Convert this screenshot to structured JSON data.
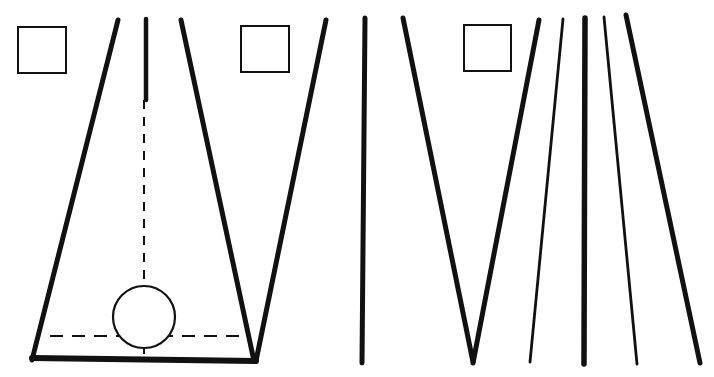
{
  "diagram": {
    "title": "",
    "colors": {
      "ink": "#111111",
      "background": "#ffffff"
    },
    "figures": [
      {
        "id": "fig-1",
        "description": "Tipi frame with three poles crossing at apex, base line, central dashed axis and circle (hearth/floor plan)",
        "checkbox": {
          "x": 18,
          "y": 27,
          "w": 48,
          "h": 46
        },
        "apex": [
          146,
          95
        ],
        "poles": [
          {
            "x1": 118,
            "y1": 20,
            "x2": 32,
            "y2": 360,
            "w": 5
          },
          {
            "x1": 146,
            "y1": 19,
            "x2": 146,
            "y2": 100,
            "w": 4.5
          },
          {
            "x1": 181,
            "y1": 20,
            "x2": 254,
            "y2": 361,
            "w": 5
          }
        ],
        "base": {
          "x1": 32,
          "y1": 358,
          "x2": 256,
          "y2": 361,
          "w": 6
        },
        "dashed_vertical": {
          "x": 144,
          "y1": 100,
          "y2": 286
        },
        "dashed_horizontal": {
          "y": 336,
          "x1": 50,
          "x2": 246
        },
        "circle": {
          "cx": 144,
          "cy": 317,
          "r": 31
        }
      },
      {
        "id": "fig-2",
        "description": "Three poles crossing at apex, center pole vertical",
        "checkbox": {
          "x": 241,
          "y": 26,
          "w": 48,
          "h": 46
        },
        "apex": [
          365,
          107
        ],
        "poles": [
          {
            "x1": 326,
            "y1": 20,
            "x2": 256,
            "y2": 361,
            "w": 5
          },
          {
            "x1": 365,
            "y1": 18,
            "x2": 362,
            "y2": 363,
            "w": 5
          },
          {
            "x1": 403,
            "y1": 18,
            "x2": 473,
            "y2": 362,
            "w": 5
          }
        ]
      },
      {
        "id": "fig-3",
        "description": "Five poles crossing at apex, thick outer and center poles, thin intermediate poles",
        "checkbox": {
          "x": 464,
          "y": 25,
          "w": 47,
          "h": 46
        },
        "apex": [
          584,
          117
        ],
        "poles": [
          {
            "x1": 539,
            "y1": 20,
            "x2": 473,
            "y2": 363,
            "w": 5
          },
          {
            "x1": 563,
            "y1": 19,
            "x2": 530,
            "y2": 362,
            "w": 2.8
          },
          {
            "x1": 585,
            "y1": 18,
            "x2": 584,
            "y2": 364,
            "w": 5.5
          },
          {
            "x1": 604,
            "y1": 17,
            "x2": 637,
            "y2": 364,
            "w": 2.8
          },
          {
            "x1": 626,
            "y1": 15,
            "x2": 700,
            "y2": 363,
            "w": 5
          }
        ]
      }
    ]
  }
}
